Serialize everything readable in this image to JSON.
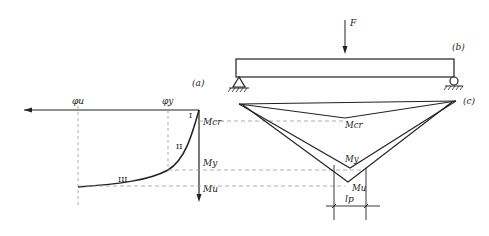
{
  "panels": {
    "a": {
      "label": "(a)"
    },
    "b": {
      "label": "(b)"
    },
    "c": {
      "label": "(c)"
    }
  },
  "load": {
    "label": "F"
  },
  "curve_axes": {
    "phi_u": "φu",
    "phi_y": "φy",
    "M_cr": "Mcr",
    "M_y": "My",
    "M_u": "Mu"
  },
  "stages": [
    "I",
    "II",
    "III"
  ],
  "moment_diagram": {
    "M_cr": "Mcr",
    "M_y": "My",
    "M_u": "Mu",
    "plastic_length": "lp"
  },
  "colors": {
    "line": "#222222",
    "dash": "#999999"
  }
}
